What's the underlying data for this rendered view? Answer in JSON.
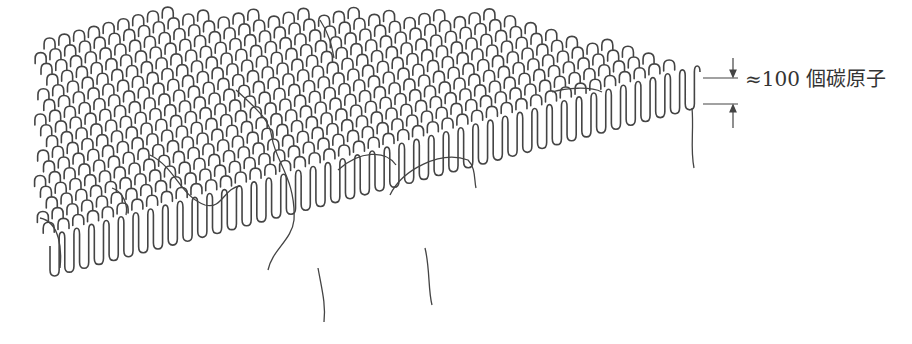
{
  "diagram": {
    "type": "polymer-lamella-chain-folding",
    "stroke_color": "#444444",
    "background": "#ffffff"
  },
  "annotation": {
    "approx_symbol": "≈",
    "value": "100",
    "unit_text": "個碳原子",
    "full_text": "≈100 個碳原子",
    "meaning": "lamella thickness"
  },
  "geometry": {
    "front_edge": {
      "x_start": 50,
      "y_start": 270,
      "x_end": 700,
      "y_end": 100,
      "folds": 44,
      "fold_depth": 28
    },
    "lamella_depth_dx": -330,
    "lamella_depth_dy": -110,
    "rows": 16
  },
  "dimension": {
    "top_line_y": 78,
    "bottom_line_y": 104,
    "line_x1": 703,
    "line_x2": 738,
    "arrow_x": 733
  }
}
